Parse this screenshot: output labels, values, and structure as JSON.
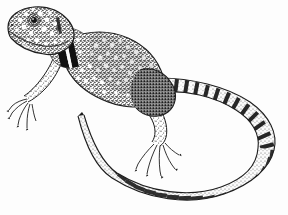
{
  "figure": {
    "name": "collared-lizard-illustration",
    "medium": "pen-and-ink stipple drawing",
    "subject": "collared lizard",
    "orientation": "dorsolateral view, head upper-left, tail sweeping right and curving down-left",
    "background_color": "#fdfdfd",
    "ink_color": "#1d1d1d",
    "mid_tone_color": "#808080",
    "width": 288,
    "height": 215,
    "has_text": false,
    "has_caption": false,
    "has_border": false
  },
  "anatomy": {
    "head": {
      "name": "head",
      "position": "upper-left",
      "cx": 46,
      "cy": 30,
      "notes": "broad triangular head, heavily stippled with pale rounded scale spots"
    },
    "eye": {
      "name": "eye",
      "cx": 34,
      "cy": 20,
      "r": 5,
      "notes": "dark pupil ringed by concentric lid scales"
    },
    "snout": {
      "name": "snout",
      "cx": 16,
      "cy": 24,
      "notes": "blunt rounded snout at far left"
    },
    "jaw": {
      "name": "lower-jaw",
      "cx": 38,
      "cy": 42,
      "notes": "pale throat beneath head"
    },
    "collar_bands": {
      "name": "collar-bands",
      "count": 2,
      "color": "#111111",
      "notes": "two black transverse collar bars across the neck separated by a pale interspace — the diagnostic marking"
    },
    "torso": {
      "name": "torso",
      "cx": 110,
      "cy": 65,
      "tone": "dense medium-gray stipple",
      "notes": "scattered white ocelli (pale spots) over the dorsum"
    },
    "front_leg": {
      "name": "front-left-leg",
      "cx": 45,
      "cy": 95,
      "toes": 5,
      "notes": "foreleg directed down-left, toes splayed with fine claws"
    },
    "hind_leg": {
      "name": "hind-left-leg",
      "cx": 160,
      "cy": 130,
      "toes": 5,
      "notes": "long hind limb with greatly elongated clawed toes pointing down"
    },
    "tail": {
      "name": "tail",
      "length_description": "very long, about twice body length",
      "path": "from hip at (165,95) sweeping right to apex near (276,135) then curving back left and down to a fine tip at (78,115)",
      "banding": "regular dark transverse bars / ladder-like segmentation along entire length",
      "tip": {
        "x": 78,
        "y": 115
      }
    }
  },
  "pattern": {
    "ocelli": {
      "name": "pale-ocelli",
      "description": "numerous small white rounded spots across neck, shoulders and dorsum",
      "color": "#ffffff"
    },
    "stipple": {
      "name": "stipple-texture",
      "description": "fine dot shading giving overall mid-gray value"
    },
    "tail_bars": {
      "name": "tail-bars",
      "description": "dark rectangular blocks alternating with pale interspaces",
      "color": "#141414"
    }
  }
}
